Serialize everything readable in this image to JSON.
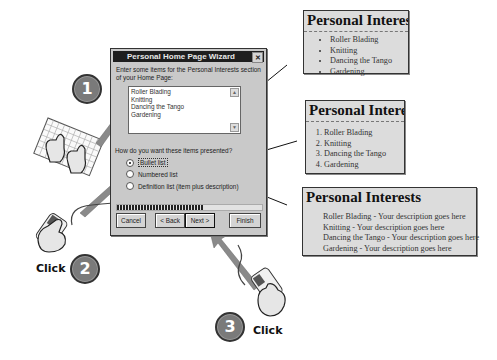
{
  "dialog": {
    "title": "Personal Home Page Wizard",
    "close_glyph": "✕",
    "intro": "Enter some items for the Personal Interests section of your Home Page:",
    "items": [
      "Roller Blading",
      "Knitting",
      "Dancing the Tango",
      "Gardening"
    ],
    "question": "How do you want these items presented?",
    "options": [
      {
        "label": "Bullet list",
        "selected": true
      },
      {
        "label": "Numbered list",
        "selected": false
      },
      {
        "label": "Definition list (item plus description)",
        "selected": false
      }
    ],
    "progress_percent": 60,
    "buttons": {
      "cancel": "Cancel",
      "back": "< Back",
      "next": "Next >",
      "finish": "Finish"
    }
  },
  "previews": {
    "bullet": {
      "heading": "Personal Interests",
      "items": [
        "Roller Blading",
        "Knitting",
        "Dancing the Tango",
        "Gardening"
      ]
    },
    "numbered": {
      "heading": "Personal Interests",
      "items": [
        "Roller Blading",
        "Knitting",
        "Dancing the Tango",
        "Gardening"
      ]
    },
    "definition": {
      "heading": "Personal Interests",
      "items": [
        "Roller Blading - Your description goes here",
        "Knitting - Your description goes here",
        "Dancing the Tango - Your description goes here",
        "Gardening - Your description goes here"
      ]
    }
  },
  "steps": {
    "step1": "1",
    "step2": "2",
    "step3": "3",
    "click_label": "Click"
  },
  "icons": {
    "keyboard": "keyboard-with-typing-hands",
    "mouse": "mouse-with-clicking-hand",
    "arrow": "gray-pointer-arrow"
  }
}
